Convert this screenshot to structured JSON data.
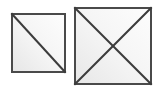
{
  "canvas": {
    "width": 157,
    "height": 92,
    "background_color": "#ffffff",
    "title": ""
  },
  "style": {
    "border_color": "#4a4a4a",
    "border_color_dark": "#3a3a3a",
    "border_width": 2,
    "diagonal_color": "#3c3c3c",
    "diagonal_width": 2,
    "fill_light": "#ffffff",
    "fill_mid": "#f5f5f5",
    "fill_shadow": "#e4e4e4"
  },
  "shapes": [
    {
      "name": "small-square",
      "label": "Small square with single diagonal",
      "x": 11,
      "y": 13,
      "width": 55,
      "height": 60,
      "diagonals": [
        "top-left-to-bottom-right"
      ],
      "diagonal_count": 1
    },
    {
      "name": "large-square",
      "label": "Large square with crossed diagonals",
      "x": 74,
      "y": 7,
      "width": 78,
      "height": 78,
      "diagonals": [
        "top-left-to-bottom-right",
        "top-right-to-bottom-left"
      ],
      "diagonal_count": 2
    }
  ]
}
